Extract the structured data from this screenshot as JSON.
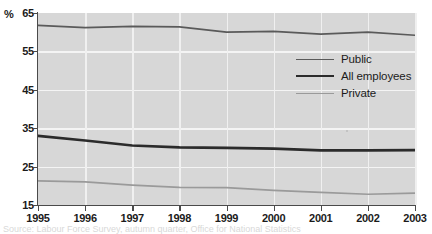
{
  "axis": {
    "unit_label": "%",
    "y_ticks": [
      65,
      55,
      45,
      35,
      25,
      15
    ],
    "x_ticks": [
      "1995",
      "1996",
      "1997",
      "1998",
      "1999",
      "2000",
      "2001",
      "2002",
      "2003"
    ]
  },
  "legend": {
    "items": [
      {
        "label": "Public",
        "color": "#5a5a5a"
      },
      {
        "label": "All employees",
        "color": "#2b2b2b"
      },
      {
        "label": "Private",
        "color": "#9a9a9a"
      }
    ]
  },
  "caption": {
    "text": "Source: Labour Force Survey, autumn quarter, Office for National Statistics"
  },
  "colors": {
    "plot_background": "#d7d7d7",
    "gridline": "#f4f4f4",
    "axis": "#4a4a4a",
    "public": "#5a5a5a",
    "all_employees": "#2b2b2b",
    "private": "#9a9a9a"
  },
  "chart_data": {
    "type": "line",
    "title": "",
    "xlabel": "",
    "ylabel": "%",
    "x": [
      1995,
      1996,
      1997,
      1998,
      1999,
      2000,
      2001,
      2002,
      2003
    ],
    "xlim": [
      1995,
      2003
    ],
    "ylim": [
      15,
      65
    ],
    "y_tick_values": [
      15,
      25,
      35,
      45,
      55,
      65
    ],
    "grid": true,
    "legend_position": "upper-right-inside",
    "series": [
      {
        "name": "Public",
        "color": "#5a5a5a",
        "width": 1.7,
        "values": [
          61.8,
          61.2,
          61.5,
          61.4,
          60.0,
          60.2,
          59.5,
          60.0,
          59.2
        ]
      },
      {
        "name": "All employees",
        "color": "#2b2b2b",
        "width": 2.7,
        "values": [
          33.0,
          31.8,
          30.5,
          30.0,
          29.9,
          29.7,
          29.2,
          29.2,
          29.3
        ]
      },
      {
        "name": "Private",
        "color": "#9a9a9a",
        "width": 1.7,
        "values": [
          21.3,
          21.0,
          20.2,
          19.6,
          19.5,
          18.8,
          18.3,
          17.8,
          18.1
        ]
      }
    ]
  }
}
